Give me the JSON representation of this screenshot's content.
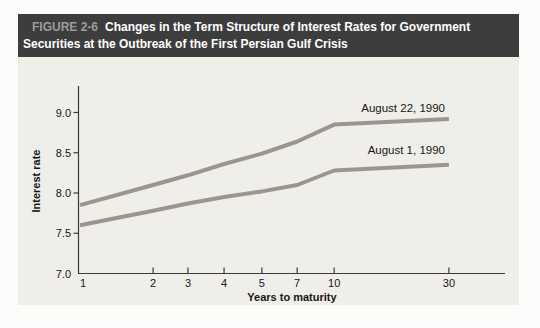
{
  "header": {
    "label": "FIGURE 2-6",
    "title_rest_line1": "Changes in the Term Structure of Interest Rates for Government",
    "title_line2": "Securities at the Outbreak of the First Persian Gulf Crisis"
  },
  "colors": {
    "page_bg": "#fcfcfa",
    "figure_bg": "#efeee9",
    "header_bg": "#3d3d3d",
    "header_label": "#9c9c9c",
    "header_text": "#ffffff",
    "axis": "#3a3a3a",
    "tick_text": "#161616",
    "line": "#98968f"
  },
  "chart_data": {
    "type": "line",
    "xlabel": "Years to maturity",
    "ylabel": "Interest rate",
    "x_scale": "compressed (log-like) maturity axis",
    "grid": false,
    "legend_position": "inline labels above right end of each line",
    "categories": [
      1,
      2,
      3,
      4,
      5,
      7,
      10,
      30
    ],
    "x_tick_labels": [
      "1",
      "2",
      "3",
      "4",
      "5",
      "7",
      "10",
      "30"
    ],
    "y_tick_labels": [
      "7.0",
      "7.5",
      "8.0",
      "8.5",
      "9.0"
    ],
    "ylim": [
      7.0,
      9.3
    ],
    "series": [
      {
        "name": "August 22, 1990",
        "values": [
          7.85,
          8.1,
          8.22,
          8.36,
          8.49,
          8.64,
          8.85,
          8.92
        ]
      },
      {
        "name": "August 1, 1990",
        "values": [
          7.6,
          7.78,
          7.87,
          7.95,
          8.02,
          8.1,
          8.28,
          8.35
        ]
      }
    ],
    "layout": {
      "x_tick_frac": [
        0.0,
        0.172,
        0.254,
        0.339,
        0.428,
        0.511,
        0.598,
        0.868
      ],
      "series_label_anchors": [
        {
          "x": 445,
          "y": 112
        },
        {
          "x": 445,
          "y": 154
        }
      ]
    }
  }
}
